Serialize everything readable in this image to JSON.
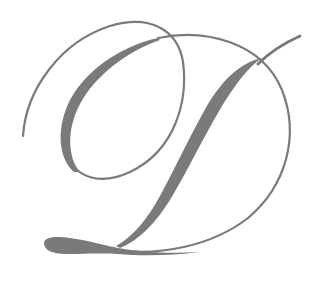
{
  "image": {
    "type": "decorative-monogram",
    "letter": "D",
    "style": "calligraphic script",
    "stroke_color": "#7a7a7a",
    "background_color": "#ffffff",
    "width": 322,
    "height": 282
  }
}
